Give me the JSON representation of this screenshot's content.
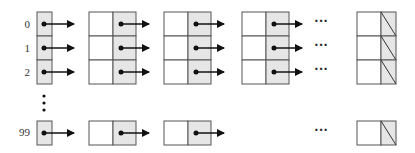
{
  "diagram": {
    "index_labels": [
      "0",
      "1",
      "2",
      "99"
    ],
    "vertical_ellipsis": "⋮",
    "horizontal_ellipsis": "···",
    "rows": [
      {
        "index": "0",
        "nodes_before_ellipsis": 3,
        "ends_with_null": true
      },
      {
        "index": "1",
        "nodes_before_ellipsis": 3,
        "ends_with_null": true
      },
      {
        "index": "2",
        "nodes_before_ellipsis": 3,
        "ends_with_null": true
      },
      {
        "index": "99",
        "nodes_before_ellipsis": 2,
        "ends_with_null": true
      }
    ],
    "colors": {
      "pointer_cell": "#e6e6e6",
      "data_cell": "#ffffff",
      "stroke": "#555555",
      "arrow": "#111111"
    }
  }
}
